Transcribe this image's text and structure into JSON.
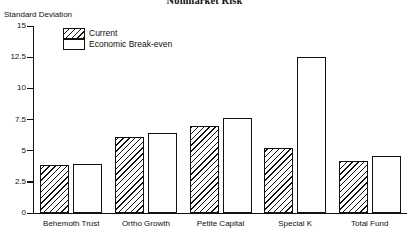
{
  "chart_data": {
    "type": "bar",
    "title": "Nonmarket Risk",
    "xlabel": "",
    "ylabel": "Standard Deviation",
    "ylim": [
      0,
      15
    ],
    "yticks": [
      "0",
      "2.5",
      "5",
      "7.5",
      "10",
      "12.5",
      "15"
    ],
    "ytick_values": [
      0,
      2.5,
      5,
      7.5,
      10,
      12.5,
      15
    ],
    "grid": false,
    "legend_position": "upper-left-inside",
    "categories": [
      "Behemoth Trust",
      "Ortho Growth",
      "Petite Capital",
      "Special K",
      "Total Fund"
    ],
    "series": [
      {
        "name": "Current",
        "fill": "hatched",
        "values": [
          3.85,
          6.1,
          6.95,
          5.2,
          4.15
        ]
      },
      {
        "name": "Economic Break-even",
        "fill": "white",
        "values": [
          3.95,
          6.4,
          7.65,
          12.5,
          4.6
        ]
      }
    ]
  },
  "colors": {
    "ink": "#111111",
    "background": "#ffffff"
  }
}
